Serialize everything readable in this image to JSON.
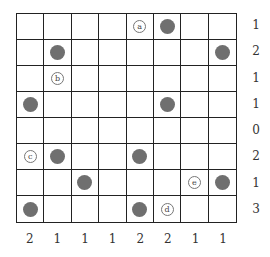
{
  "puzzle": {
    "rows": 8,
    "cols": 8,
    "row_clues": [
      "1",
      "2",
      "1",
      "1",
      "0",
      "2",
      "1",
      "3"
    ],
    "col_clues": [
      "2",
      "1",
      "1",
      "1",
      "2",
      "2",
      "1",
      "1"
    ],
    "dots": [
      [
        0,
        5
      ],
      [
        1,
        1
      ],
      [
        1,
        7
      ],
      [
        3,
        0
      ],
      [
        3,
        5
      ],
      [
        5,
        1
      ],
      [
        5,
        4
      ],
      [
        6,
        2
      ],
      [
        6,
        7
      ],
      [
        7,
        0
      ],
      [
        7,
        4
      ]
    ],
    "labels": [
      {
        "row": 0,
        "col": 4,
        "text": "a"
      },
      {
        "row": 2,
        "col": 1,
        "text": "b"
      },
      {
        "row": 5,
        "col": 0,
        "text": "c"
      },
      {
        "row": 7,
        "col": 5,
        "text": "d"
      },
      {
        "row": 6,
        "col": 6,
        "text": "e"
      }
    ],
    "colors": {
      "dot": "#6f6f6f",
      "grid": "#222222"
    }
  }
}
